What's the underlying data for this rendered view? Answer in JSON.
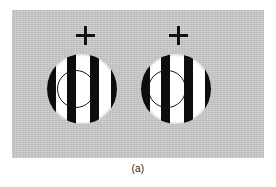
{
  "figure": {
    "caption": "(a)",
    "panel": {
      "background_color": "#c8c8c8",
      "x": 12,
      "y": 10,
      "width": 252,
      "height": 148
    },
    "stimuli": [
      {
        "id": "left",
        "name": "left-grating-stimulus",
        "fixation_cross": {
          "label": "+",
          "center_x": 85,
          "center_y": 35,
          "size": 19,
          "color": "#121212"
        },
        "disk": {
          "center_x": 82,
          "center_y": 89,
          "diameter": 70,
          "orientation": "vertical",
          "bar_color": "#0d0d0d",
          "background_color": "#ffffff",
          "stripes": [
            {
              "left": 0,
              "width": 9
            },
            {
              "left": 20,
              "width": 9
            },
            {
              "left": 43,
              "width": 9
            },
            {
              "left": 64,
              "width": 6
            }
          ],
          "inner_circle": {
            "center_x": 29,
            "center_y": 35,
            "diameter": 38,
            "stroke_color": "#141414"
          }
        }
      },
      {
        "id": "right",
        "name": "right-grating-stimulus",
        "fixation_cross": {
          "label": "+",
          "center_x": 178,
          "center_y": 35,
          "size": 19,
          "color": "#121212"
        },
        "disk": {
          "center_x": 176,
          "center_y": 89,
          "diameter": 70,
          "orientation": "vertical",
          "bar_color": "#0d0d0d",
          "background_color": "#ffffff",
          "stripes": [
            {
              "left": 0,
              "width": 9
            },
            {
              "left": 20,
              "width": 9
            },
            {
              "left": 43,
              "width": 9
            },
            {
              "left": 64,
              "width": 6
            }
          ],
          "inner_circle": {
            "center_x": 26,
            "center_y": 35,
            "diameter": 38,
            "stroke_color": "#141414"
          }
        }
      }
    ]
  }
}
